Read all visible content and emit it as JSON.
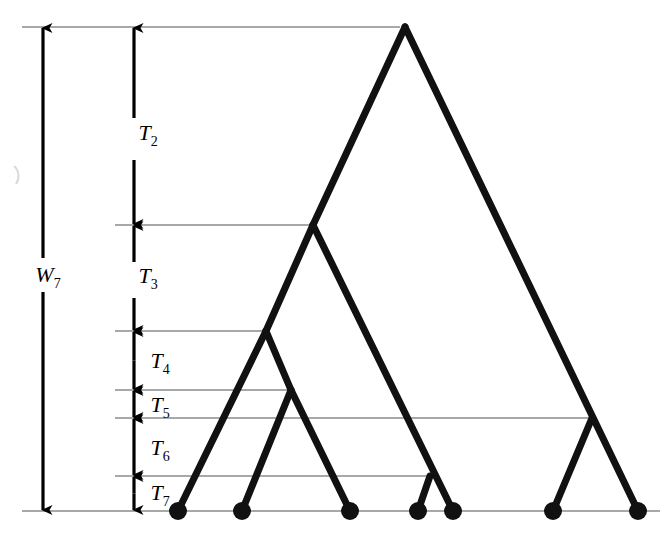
{
  "figure": {
    "type": "coalescent-genealogy-diagram",
    "background_color": "#ffffff",
    "width": 670,
    "height": 539,
    "tree_color": "#111111",
    "gridline_color": "#a8a8a8",
    "axis_color": "#000000"
  },
  "labels": {
    "total_height": {
      "base": "W",
      "sub": "7",
      "text": "W7",
      "x": 48,
      "y": 282
    },
    "intervals": [
      {
        "id": "T2",
        "base": "T",
        "sub": "2",
        "text": "T2",
        "x": 148,
        "y": 140
      },
      {
        "id": "T3",
        "base": "T",
        "sub": "3",
        "text": "T3",
        "x": 148,
        "y": 283
      },
      {
        "id": "T4",
        "base": "T",
        "sub": "4",
        "text": "T4",
        "x": 160,
        "y": 368
      },
      {
        "id": "T5",
        "base": "T",
        "sub": "5",
        "text": "T5",
        "x": 160,
        "y": 412
      },
      {
        "id": "T6",
        "base": "T",
        "sub": "6",
        "text": "T6",
        "x": 160,
        "y": 455
      },
      {
        "id": "T7",
        "base": "T",
        "sub": "7",
        "text": "T7",
        "x": 160,
        "y": 500
      }
    ]
  },
  "gridlines": [
    {
      "id": "level-root",
      "y": 27,
      "x1": 22,
      "x2": 400
    },
    {
      "id": "level-2",
      "y": 225,
      "x1": 115,
      "x2": 313
    },
    {
      "id": "level-3",
      "y": 331,
      "x1": 115,
      "x2": 266
    },
    {
      "id": "level-4",
      "y": 390,
      "x1": 115,
      "x2": 291
    },
    {
      "id": "level-5",
      "y": 418,
      "x1": 115,
      "x2": 592
    },
    {
      "id": "level-6",
      "y": 476,
      "x1": 115,
      "x2": 430
    },
    {
      "id": "baseline",
      "y": 511,
      "x1": 22,
      "x2": 660
    }
  ],
  "axes": [
    {
      "id": "W7-axis",
      "label": "W7",
      "x": 43,
      "y_top": 27,
      "y_bottom": 511,
      "gap_top": 258,
      "gap_bottom": 292,
      "arrow_top": true,
      "arrow_bottom": true
    },
    {
      "id": "T2-axis",
      "label": "T2",
      "x": 134,
      "y_top": 27,
      "y_bottom": 225,
      "gap_top": 118,
      "gap_bottom": 160,
      "arrow_top": true,
      "arrow_bottom": true
    },
    {
      "id": "T3-axis",
      "label": "T3",
      "x": 134,
      "y_top": 225,
      "y_bottom": 331,
      "gap_top": 262,
      "gap_bottom": 298,
      "arrow_top": true,
      "arrow_bottom": true
    },
    {
      "id": "T4-axis",
      "label": "T4",
      "x": 134,
      "y_top": 331,
      "y_bottom": 390,
      "gap_top": 331,
      "gap_bottom": 331,
      "arrow_top": true,
      "arrow_bottom": true
    },
    {
      "id": "T5-axis",
      "label": "T5",
      "x": 134,
      "y_top": 390,
      "y_bottom": 418,
      "gap_top": 390,
      "gap_bottom": 390,
      "arrow_top": true,
      "arrow_bottom": true
    },
    {
      "id": "T6-axis",
      "label": "T6",
      "x": 134,
      "y_top": 418,
      "y_bottom": 476,
      "gap_top": 418,
      "gap_bottom": 418,
      "arrow_top": true,
      "arrow_bottom": true
    },
    {
      "id": "T7-axis",
      "label": "T7",
      "x": 134,
      "y_top": 476,
      "y_bottom": 511,
      "gap_top": 476,
      "gap_bottom": 476,
      "arrow_top": true,
      "arrow_bottom": true
    }
  ],
  "tree": {
    "tips": [
      {
        "id": "tip-1",
        "x": 178,
        "y": 511
      },
      {
        "id": "tip-2",
        "x": 242,
        "y": 511
      },
      {
        "id": "tip-3",
        "x": 350,
        "y": 511
      },
      {
        "id": "tip-4",
        "x": 418,
        "y": 511
      },
      {
        "id": "tip-5",
        "x": 453,
        "y": 511
      },
      {
        "id": "tip-6",
        "x": 553,
        "y": 511
      },
      {
        "id": "tip-7",
        "x": 638,
        "y": 511
      }
    ],
    "internal_nodes": [
      {
        "id": "node-root",
        "x": 405,
        "y": 27
      },
      {
        "id": "node-2",
        "x": 313,
        "y": 225
      },
      {
        "id": "node-3",
        "x": 266,
        "y": 331
      },
      {
        "id": "node-4",
        "x": 291,
        "y": 390
      },
      {
        "id": "node-5",
        "x": 592,
        "y": 418
      },
      {
        "id": "node-6",
        "x": 430,
        "y": 476
      }
    ],
    "branches": [
      {
        "id": "branch-root-left",
        "x1": 405,
        "y1": 27,
        "x2": 313,
        "y2": 225
      },
      {
        "id": "branch-root-right",
        "x1": 405,
        "y1": 27,
        "x2": 638,
        "y2": 511
      },
      {
        "id": "branch-n2-left",
        "x1": 313,
        "y1": 225,
        "x2": 266,
        "y2": 331
      },
      {
        "id": "branch-n2-right",
        "x1": 313,
        "y1": 225,
        "x2": 453,
        "y2": 511
      },
      {
        "id": "branch-n3-left",
        "x1": 266,
        "y1": 331,
        "x2": 178,
        "y2": 511
      },
      {
        "id": "branch-n3-right",
        "x1": 266,
        "y1": 331,
        "x2": 291,
        "y2": 390
      },
      {
        "id": "branch-n4-left",
        "x1": 291,
        "y1": 390,
        "x2": 242,
        "y2": 511
      },
      {
        "id": "branch-n4-right",
        "x1": 291,
        "y1": 390,
        "x2": 350,
        "y2": 511
      },
      {
        "id": "branch-n5-left",
        "x1": 592,
        "y1": 418,
        "x2": 553,
        "y2": 511
      },
      {
        "id": "branch-n6-left",
        "x1": 430,
        "y1": 476,
        "x2": 418,
        "y2": 511
      }
    ],
    "tip_radius": 9,
    "branch_width": 7
  }
}
